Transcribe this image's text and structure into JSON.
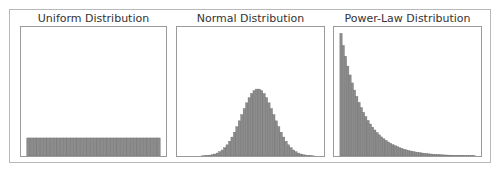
{
  "colors": {
    "bar_fill": "#8c8c8c",
    "bar_edge": "#6e6e6e",
    "frame": "#9a9a9a",
    "outer": "#b8b8b8",
    "title": "#333333"
  },
  "chart_data": [
    {
      "type": "bar",
      "title": "Uniform Distribution",
      "xlabel": "",
      "ylabel": "",
      "grid": false,
      "bins": 40,
      "values": [
        1,
        1,
        1,
        1,
        1,
        1,
        1,
        1,
        1,
        1,
        1,
        1,
        1,
        1,
        1,
        1,
        1,
        1,
        1,
        1,
        1,
        1,
        1,
        1,
        1,
        1,
        1,
        1,
        1,
        1,
        1,
        1,
        1,
        1,
        1,
        1,
        1,
        1,
        1,
        1
      ],
      "ylim": [
        0,
        7.5
      ],
      "x_range": [
        0.04,
        0.96
      ]
    },
    {
      "type": "bar",
      "title": "Normal Distribution",
      "xlabel": "",
      "ylabel": "",
      "grid": false,
      "bins": 60,
      "description": "Gaussian histogram centered in panel; peak reaches ~50% of panel height",
      "mean": 0.55,
      "std": 0.11,
      "peak_fraction_of_height": 0.52,
      "x_range": [
        0.0,
        1.0
      ]
    },
    {
      "type": "bar",
      "title": "Power-Law Distribution",
      "xlabel": "",
      "ylabel": "",
      "grid": false,
      "bins": 60,
      "description": "Monotonically decaying histogram; tallest at left edge (~95% of panel height), near zero by ~65% of width",
      "peak_fraction_of_height": 0.95,
      "decay": "exponential-like",
      "x_range": [
        0.04,
        0.96
      ]
    }
  ]
}
